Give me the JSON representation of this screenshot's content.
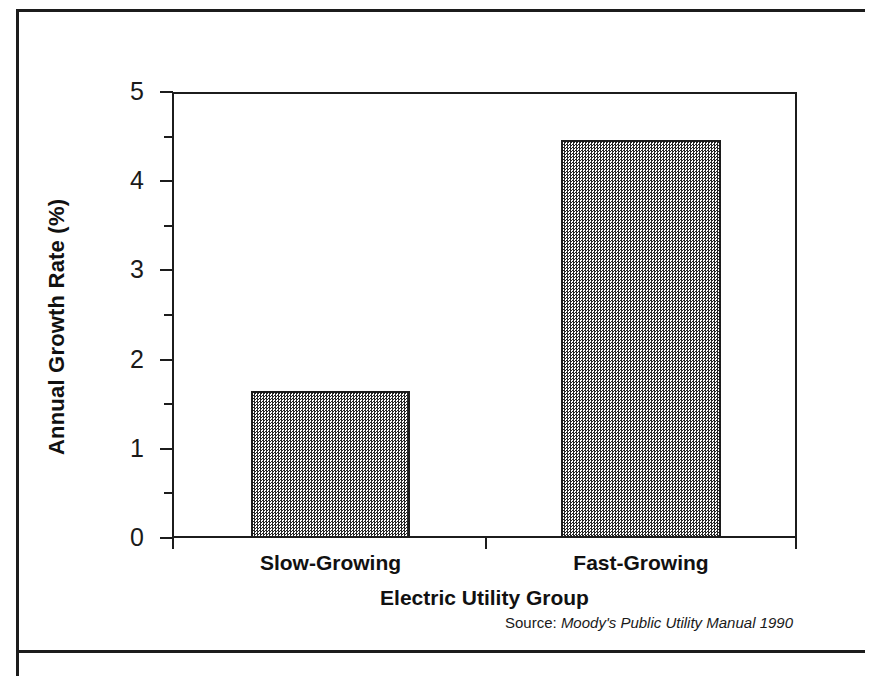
{
  "figure": {
    "source_prefix": "Source:",
    "source_publication": "Moody's Public Utility Manual 1990"
  },
  "chart_data": {
    "type": "bar",
    "title": "",
    "subtitle": "",
    "categories": [
      "Slow-Growing",
      "Fast-Growing"
    ],
    "values": [
      1.65,
      4.46
    ],
    "series": [
      {
        "name": "Annual Growth Rate",
        "values": [
          1.65,
          4.46
        ]
      }
    ],
    "xlabel": "Electric Utility Group",
    "ylabel": "Annual Growth Rate (%)",
    "ylim": [
      0,
      5
    ],
    "y_major_ticks": [
      0,
      1,
      2,
      3,
      4,
      5
    ],
    "y_tick_labels": [
      "0",
      "1",
      "2",
      "3",
      "4",
      "5"
    ],
    "y_minor_ticks": [
      0.5,
      1.5,
      2.5,
      3.5,
      4.5
    ],
    "grid": false,
    "legend": "none",
    "bar_fill": "#808080",
    "bar_fill_style": "checkerboard-dither",
    "bar_edge_color": "#1c1c1c",
    "axis_color": "#1c1c1c",
    "annotations": [
      "Source: Moody's Public Utility Manual 1990"
    ]
  }
}
